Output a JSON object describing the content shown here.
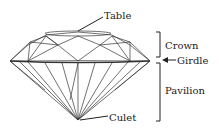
{
  "diagram": {
    "labels": {
      "table": "Table",
      "crown": "Crown",
      "girdle": "Girdle",
      "pavilion": "Pavilion",
      "culet": "Culet"
    },
    "colors": {
      "line": "#333333",
      "background": "#ffffff"
    }
  }
}
